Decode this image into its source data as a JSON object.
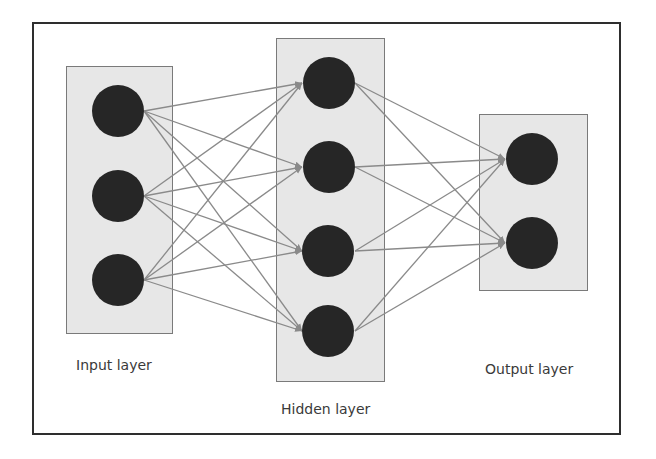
{
  "diagram": {
    "type": "neural-network",
    "colors": {
      "frame_border": "#2e2e2e",
      "layer_fill": "#e7e7e7",
      "layer_border": "#7a7a7a",
      "node_fill": "#262626",
      "edge": "#8a8a8a"
    },
    "layers": [
      {
        "id": "input",
        "label": "Input layer",
        "node_count": 3
      },
      {
        "id": "hidden",
        "label": "Hidden layer",
        "node_count": 4
      },
      {
        "id": "output",
        "label": "Output layer",
        "node_count": 2
      }
    ],
    "connections": "fully-connected between consecutive layers (input→hidden: 12 edges, hidden→output: 8 edges), arrows point right"
  }
}
